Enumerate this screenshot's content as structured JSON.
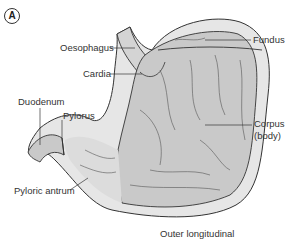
{
  "figure": {
    "panel_label": "A",
    "caption": "Outer longitudinal",
    "labels": {
      "oesophagus": "Oesophagus",
      "cardia": "Cardia",
      "fundus": "Fundus",
      "duodenum": "Duodenum",
      "pylorus": "Pylorus",
      "corpus": "Corpus",
      "corpus_sub": "(body)",
      "pyloric_antrum": "Pyloric antrum"
    },
    "colors": {
      "outer_wall": "#e6e6e6",
      "inner_mucosa": "#c9c9c9",
      "outline": "#333333",
      "label_text": "#333333"
    }
  }
}
